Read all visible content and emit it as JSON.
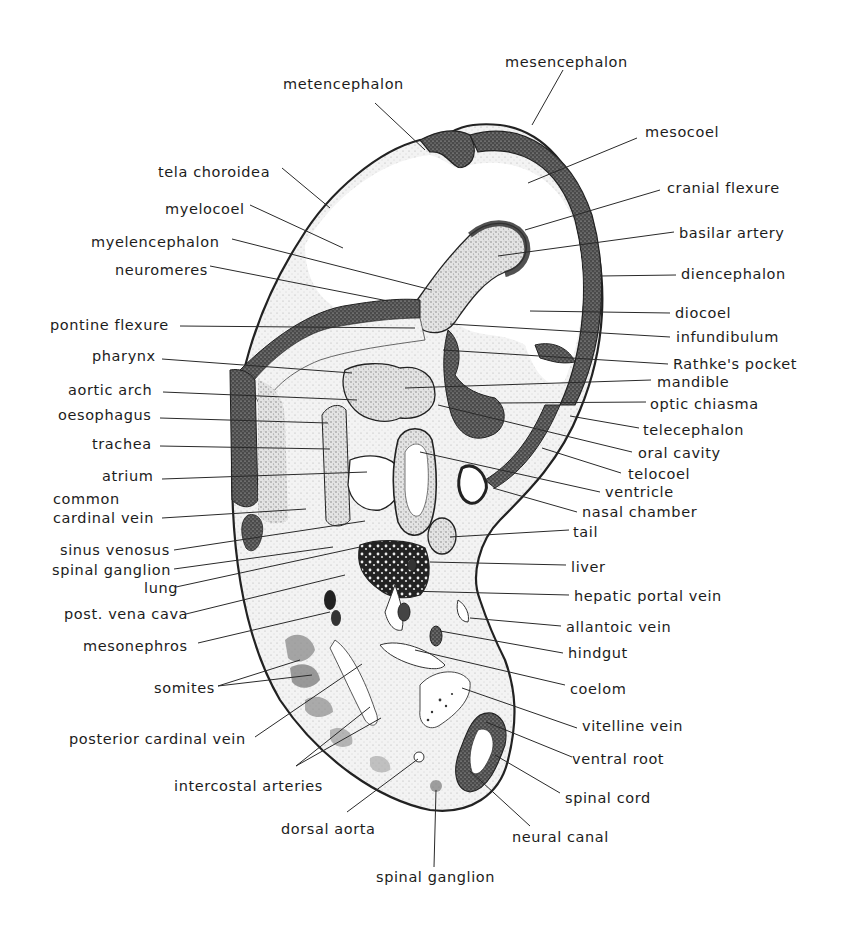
{
  "figure": {
    "labels_left": [
      {
        "id": "metencephalon",
        "text": "metencephalon",
        "x": 283,
        "y": 76,
        "lx": 375,
        "ly": 103,
        "px": 425,
        "py": 150
      },
      {
        "id": "tela-choroidea",
        "text": "tela choroidea",
        "x": 158,
        "y": 164,
        "lx": 282,
        "ly": 168,
        "px": 330,
        "py": 208
      },
      {
        "id": "myelocoel",
        "text": "myelocoel",
        "x": 165,
        "y": 201,
        "lx": 250,
        "ly": 205,
        "px": 343,
        "py": 248
      },
      {
        "id": "myelencephalon",
        "text": "myelencephalon",
        "x": 91,
        "y": 234,
        "lx": 232,
        "ly": 239,
        "px": 432,
        "py": 290
      },
      {
        "id": "neuromeres",
        "text": "neuromeres",
        "x": 115,
        "y": 262,
        "lx": 210,
        "ly": 266,
        "px": 388,
        "py": 301
      },
      {
        "id": "pontine-flexure",
        "text": "pontine flexure",
        "x": 50,
        "y": 317,
        "lx": 180,
        "ly": 326,
        "px": 415,
        "py": 328
      },
      {
        "id": "pharynx",
        "text": "pharynx",
        "x": 92,
        "y": 348,
        "lx": 162,
        "ly": 359,
        "px": 352,
        "py": 373
      },
      {
        "id": "aortic-arch",
        "text": "aortic arch",
        "x": 68,
        "y": 382,
        "lx": 163,
        "ly": 392,
        "px": 357,
        "py": 400
      },
      {
        "id": "oesophagus",
        "text": "oesophagus",
        "x": 58,
        "y": 407,
        "lx": 160,
        "ly": 418,
        "px": 328,
        "py": 423
      },
      {
        "id": "trachea",
        "text": "trachea",
        "x": 92,
        "y": 436,
        "lx": 160,
        "ly": 446,
        "px": 330,
        "py": 449
      },
      {
        "id": "atrium",
        "text": "atrium",
        "x": 102,
        "y": 468,
        "lx": 162,
        "ly": 479,
        "px": 367,
        "py": 472
      },
      {
        "id": "common-cardinal-vein-1",
        "text": "common",
        "x": 53,
        "y": 491,
        "lx": null,
        "ly": null,
        "px": null,
        "py": null
      },
      {
        "id": "common-cardinal-vein",
        "text": "cardinal vein",
        "x": 53,
        "y": 510,
        "lx": 162,
        "ly": 518,
        "px": 306,
        "py": 509
      },
      {
        "id": "sinus-venosus",
        "text": "sinus venosus",
        "x": 60,
        "y": 542,
        "lx": 174,
        "ly": 550,
        "px": 365,
        "py": 521
      },
      {
        "id": "spinal-ganglion-upper",
        "text": "spinal ganglion",
        "x": 52,
        "y": 562,
        "lx": 174,
        "ly": 569,
        "px": 333,
        "py": 547
      },
      {
        "id": "lung",
        "text": "lung",
        "x": 144,
        "y": 580,
        "lx": 176,
        "ly": 587,
        "px": 360,
        "py": 547
      },
      {
        "id": "post-vena-cava",
        "text": "post. vena cava",
        "x": 64,
        "y": 606,
        "lx": 186,
        "ly": 614,
        "px": 345,
        "py": 575
      },
      {
        "id": "mesonephros",
        "text": "mesonephros",
        "x": 83,
        "y": 638,
        "lx": 198,
        "ly": 643,
        "px": 330,
        "py": 612
      },
      {
        "id": "somites",
        "text": "somites",
        "x": 154,
        "y": 680,
        "lx": 218,
        "ly": 686,
        "px": 300,
        "py": 660,
        "px2": 312,
        "py2": 675
      },
      {
        "id": "posterior-cardinal-vein",
        "text": "posterior cardinal vein",
        "x": 69,
        "y": 731,
        "lx": 255,
        "ly": 737,
        "px": 362,
        "py": 664
      },
      {
        "id": "intercostal-arteries",
        "text": "intercostal arteries",
        "x": 174,
        "y": 778,
        "lx": 296,
        "ly": 766,
        "px": 370,
        "py": 707,
        "px2": 381,
        "py2": 718
      },
      {
        "id": "dorsal-aorta",
        "text": "dorsal aorta",
        "x": 281,
        "y": 821,
        "lx": 347,
        "ly": 812,
        "px": 418,
        "py": 759
      },
      {
        "id": "spinal-ganglion-lower",
        "text": "spinal ganglion",
        "x": 376,
        "y": 869,
        "lx": 434,
        "ly": 867,
        "px": 436,
        "py": 790
      }
    ],
    "labels_right": [
      {
        "id": "mesencephalon",
        "text": "mesencephalon",
        "x": 505,
        "y": 54,
        "lx": 563,
        "ly": 70,
        "px": 532,
        "py": 125
      },
      {
        "id": "mesocoel",
        "text": "mesocoel",
        "x": 645,
        "y": 124,
        "lx": 637,
        "ly": 138,
        "px": 528,
        "py": 183
      },
      {
        "id": "cranial-flexure",
        "text": "cranial flexure",
        "x": 667,
        "y": 180,
        "lx": 660,
        "ly": 190,
        "px": 525,
        "py": 230
      },
      {
        "id": "basilar-artery",
        "text": "basilar artery",
        "x": 679,
        "y": 225,
        "lx": 674,
        "ly": 232,
        "px": 498,
        "py": 256
      },
      {
        "id": "diencephalon",
        "text": "diencephalon",
        "x": 681,
        "y": 266,
        "lx": 676,
        "ly": 275,
        "px": 600,
        "py": 276
      },
      {
        "id": "diocoel",
        "text": "diocoel",
        "x": 675,
        "y": 305,
        "lx": 670,
        "ly": 313,
        "px": 530,
        "py": 311
      },
      {
        "id": "infundibulum",
        "text": "infundibulum",
        "x": 676,
        "y": 329,
        "lx": 670,
        "ly": 337,
        "px": 450,
        "py": 324
      },
      {
        "id": "rathkes-pocket",
        "text": "Rathke's pocket",
        "x": 673,
        "y": 356,
        "lx": 668,
        "ly": 364,
        "px": 443,
        "py": 350
      },
      {
        "id": "mandible",
        "text": "mandible",
        "x": 657,
        "y": 374,
        "lx": 651,
        "ly": 380,
        "px": 405,
        "py": 388
      },
      {
        "id": "optic-chiasma",
        "text": "optic chiasma",
        "x": 650,
        "y": 396,
        "lx": 646,
        "ly": 402,
        "px": 498,
        "py": 403
      },
      {
        "id": "telecephalon",
        "text": "telecephalon",
        "x": 643,
        "y": 422,
        "lx": 639,
        "ly": 428,
        "px": 570,
        "py": 416
      },
      {
        "id": "oral-cavity",
        "text": "oral cavity",
        "x": 638,
        "y": 445,
        "lx": 632,
        "ly": 452,
        "px": 438,
        "py": 405
      },
      {
        "id": "telocoel",
        "text": "telocoel",
        "x": 628,
        "y": 466,
        "lx": 621,
        "ly": 473,
        "px": 542,
        "py": 448
      },
      {
        "id": "ventricle",
        "text": "ventricle",
        "x": 605,
        "y": 484,
        "lx": 600,
        "ly": 492,
        "px": 420,
        "py": 452
      },
      {
        "id": "nasal-chamber",
        "text": "nasal chamber",
        "x": 582,
        "y": 504,
        "lx": 577,
        "ly": 512,
        "px": 493,
        "py": 488
      },
      {
        "id": "tail",
        "text": "tail",
        "x": 573,
        "y": 524,
        "lx": 569,
        "ly": 530,
        "px": 450,
        "py": 537
      },
      {
        "id": "liver",
        "text": "liver",
        "x": 571,
        "y": 559,
        "lx": 566,
        "ly": 565,
        "px": 430,
        "py": 562
      },
      {
        "id": "hepatic-portal-vein",
        "text": "hepatic portal vein",
        "x": 574,
        "y": 588,
        "lx": 569,
        "ly": 595,
        "px": 405,
        "py": 591
      },
      {
        "id": "allantoic-vein",
        "text": "allantoic vein",
        "x": 566,
        "y": 619,
        "lx": 561,
        "ly": 626,
        "px": 470,
        "py": 618
      },
      {
        "id": "hindgut",
        "text": "hindgut",
        "x": 568,
        "y": 645,
        "lx": 563,
        "ly": 653,
        "px": 440,
        "py": 631
      },
      {
        "id": "coelom",
        "text": "coelom",
        "x": 570,
        "y": 681,
        "lx": 565,
        "ly": 685,
        "px": 415,
        "py": 650
      },
      {
        "id": "vitelline-vein",
        "text": "vitelline vein",
        "x": 582,
        "y": 718,
        "lx": 577,
        "ly": 728,
        "px": 462,
        "py": 688
      },
      {
        "id": "ventral-root",
        "text": "ventral root",
        "x": 572,
        "y": 751,
        "lx": 572,
        "ly": 757,
        "px": 486,
        "py": 722
      },
      {
        "id": "spinal-cord",
        "text": "spinal cord",
        "x": 565,
        "y": 790,
        "lx": 560,
        "ly": 793,
        "px": 495,
        "py": 755
      },
      {
        "id": "neural-canal",
        "text": "neural canal",
        "x": 512,
        "y": 829,
        "lx": 530,
        "ly": 826,
        "px": 470,
        "py": 771
      }
    ]
  },
  "colors": {
    "ink": "#1c1c1c",
    "background": "#ffffff",
    "stipple_dark": "#3a3a3a",
    "stipple_mid": "#9a9a9a",
    "stipple_light": "#d8d8d8"
  }
}
